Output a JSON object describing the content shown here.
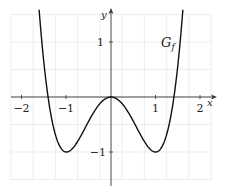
{
  "chart_data": {
    "type": "line",
    "title": "",
    "function": "f(x) = x^4 - 2x^2",
    "series": [
      {
        "name": "G_f",
        "x": [
          -1.61,
          -1.5,
          -1.414,
          -1.25,
          -1.0,
          -0.75,
          -0.5,
          -0.25,
          0,
          0.25,
          0.5,
          0.75,
          1.0,
          1.25,
          1.414,
          1.5,
          1.61
        ],
        "values": [
          1.54,
          0.56,
          0.0,
          -0.68,
          -1.0,
          -0.81,
          -0.44,
          -0.12,
          0,
          -0.12,
          -0.44,
          -0.81,
          -1.0,
          -0.68,
          0.0,
          0.56,
          1.54
        ]
      }
    ],
    "xlabel": "x",
    "ylabel": "y",
    "x_ticks": [
      "-2",
      "-1",
      "1",
      "2"
    ],
    "y_ticks": [
      "1",
      "-1"
    ],
    "xlim": [
      -2.25,
      2.35
    ],
    "ylim": [
      -1.6,
      1.6
    ],
    "grid": true,
    "legend": null,
    "annotations": [
      {
        "text": "G_f",
        "x": 1.25,
        "y": 1.0
      }
    ]
  },
  "labels": {
    "x_axis": "x",
    "y_axis": "y",
    "curve_main": "G",
    "curve_sub": "f",
    "tick_x_m2": "−2",
    "tick_x_m1": "−1",
    "tick_x_1": "1",
    "tick_x_2": "2",
    "tick_y_1": "1",
    "tick_y_m1": "−1"
  },
  "colors": {
    "curve": "#111111",
    "axes": "#333333",
    "grid": "#e6e6e6"
  }
}
